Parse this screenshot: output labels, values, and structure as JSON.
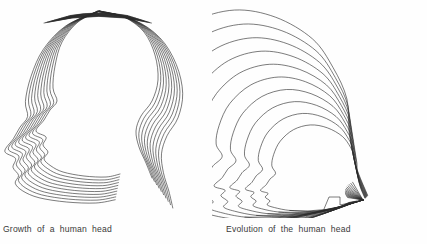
{
  "page": {
    "background_color": "#fefefe",
    "line_color": "#2b2b2b",
    "width": 427,
    "height": 244
  },
  "figures": [
    {
      "id": "growth",
      "caption": "Growth of a human head",
      "description": "Nested left-facing human head profiles converging at the crown of the skull and fanning outward at the face, jaw and neck",
      "contour_count": 10,
      "convergence": "top of skull",
      "facing": "left"
    },
    {
      "id": "evolution",
      "caption": "Evolution of the human head",
      "description": "Nested left-facing human head profiles radiating outward from a convergence point at the base of the back of the neck",
      "contour_count": 10,
      "convergence": "base of rear neck",
      "facing": "left"
    }
  ]
}
